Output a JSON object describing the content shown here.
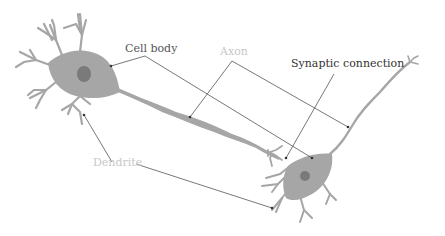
{
  "diagram": {
    "labels": {
      "cell_body": "Cell body",
      "axon": "Axon",
      "synaptic_connection": "Synaptic connection",
      "dendrite": "Dendrite"
    },
    "colors": {
      "neuron_fill": "#a6a6a6",
      "nucleus_fill": "#7a7a7a",
      "leader_line": "#555555",
      "dark_label": "#333333",
      "light_label": "#c8c8c8",
      "background": "#ffffff"
    }
  }
}
